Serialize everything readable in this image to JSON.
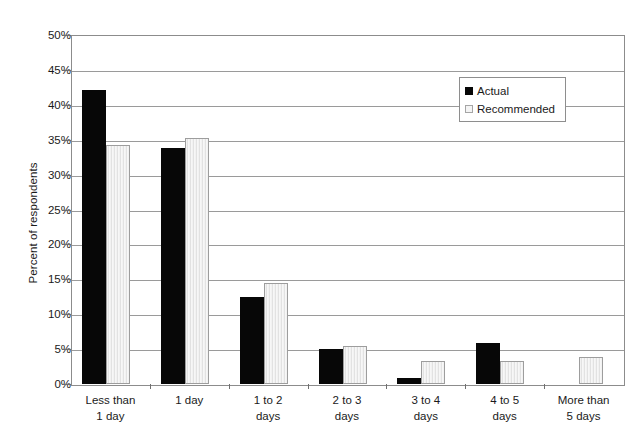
{
  "chart_data": {
    "type": "bar",
    "title": "",
    "xlabel": "",
    "ylabel": "Percent of respondents",
    "ylim": [
      0,
      50
    ],
    "ytick_step": 5,
    "ytick_labels": [
      "0%",
      "5%",
      "10%",
      "15%",
      "20%",
      "25%",
      "30%",
      "35%",
      "40%",
      "45%",
      "50%"
    ],
    "grid": true,
    "legend_position": "top-right",
    "categories": [
      "Less than 1 day",
      "1 day",
      "1 to 2 days",
      "2 to 3 days",
      "3 to 4 days",
      "4 to 5 days",
      "More than 5 days"
    ],
    "category_lines": [
      [
        "Less than",
        "1 day"
      ],
      [
        "1 day",
        ""
      ],
      [
        "1 to 2",
        "days"
      ],
      [
        "2 to 3",
        "days"
      ],
      [
        "3 to 4",
        "days"
      ],
      [
        "4 to 5",
        "days"
      ],
      [
        "More than",
        "5 days"
      ]
    ],
    "series": [
      {
        "name": "Actual",
        "color": "#070707",
        "values": [
          42.1,
          33.8,
          12.4,
          5.0,
          0.8,
          5.9,
          0.0
        ]
      },
      {
        "name": "Recommended",
        "color": "#f2f2f2",
        "values": [
          34.3,
          35.2,
          14.5,
          5.5,
          3.3,
          3.3,
          3.9
        ]
      }
    ]
  },
  "legend": {
    "entries": [
      {
        "label": "Actual",
        "swatch": "filled-black-square"
      },
      {
        "label": "Recommended",
        "swatch": "light-hatched-square"
      }
    ]
  },
  "colors": {
    "actual": "#070707",
    "recommended": "#f2f2f2",
    "gridline": "#9a9a9a",
    "axis": "#8c8c8c",
    "text": "#1a1a1a"
  }
}
